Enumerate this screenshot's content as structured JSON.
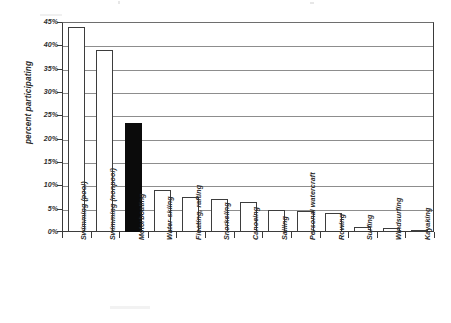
{
  "chart_data": {
    "type": "bar",
    "title": "",
    "subtitle": "",
    "xlabel": "",
    "ylabel": "percent participating",
    "ylim": [
      0,
      45
    ],
    "ytick_step": 5,
    "ytick_labels": [
      "45%",
      "40%",
      "35%",
      "30%",
      "25%",
      "20%",
      "15%",
      "10%",
      "5%",
      "0%"
    ],
    "ytick_values": [
      45,
      40,
      35,
      30,
      25,
      20,
      15,
      10,
      5,
      0
    ],
    "grid": true,
    "grid_axis": "y",
    "legend": false,
    "legend_position": "none",
    "value_format": "percent",
    "categories": [
      "Swimming (pool)",
      "Swimming (nonpool)",
      "Motorboating",
      "Water-skiing",
      "Floating, rafting",
      "Snorkeling",
      "Canoeing",
      "Sailing",
      "Personal watercraft",
      "Rowing",
      "Surfing",
      "Windsurfing",
      "Kayaking"
    ],
    "values": [
      44.0,
      39.0,
      23.3,
      8.9,
      7.5,
      7.1,
      6.5,
      4.7,
      4.5,
      4.1,
      1.1,
      0.9,
      0.5
    ],
    "highlighted_categories": [
      "Motorboating"
    ],
    "bar_style": {
      "default_fill": "#ffffff",
      "default_edge": "#3d3d3d",
      "highlight_fill": "#0b0b0b",
      "highlight_edge": "#0b0b0b"
    },
    "axis_color": "#3a3a3a",
    "grid_color": "#8d8d8d",
    "text_color": "#2b2b2b"
  }
}
